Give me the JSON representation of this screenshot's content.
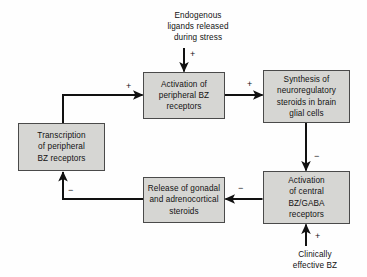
{
  "diagram": {
    "background_color": "#fefefe",
    "node_fill_color": "#d6d6d3",
    "node_border_color": "#4a4a4a",
    "edge_color": "#111111",
    "text_color": "#121212",
    "nodes": [
      {
        "id": "activation-peripheral",
        "label": "Activation of\nperipheral BZ\nreceptors",
        "lines": [
          "Activation of",
          "peripheral BZ",
          "receptors"
        ]
      },
      {
        "id": "synthesis-steroids",
        "label": "Synthesis of\nneuroregulatory\nsteroids in brain\nglial cells",
        "lines": [
          "Synthesis of",
          "neuroregulatory",
          "steroids in brain",
          "glial cells"
        ]
      },
      {
        "id": "transcription",
        "label": "Transcription\nof peripheral\nBZ receptors",
        "lines": [
          "Transcription",
          "of peripheral",
          "BZ receptors"
        ]
      },
      {
        "id": "release-gonadal",
        "label": "Release of gonadal\nand adrenocortical\nsteroids",
        "lines": [
          "Release of gonadal",
          "and adrenocortical",
          "steroids"
        ]
      },
      {
        "id": "activation-central",
        "label": "Activation\nof central\nBZ/GABA\nreceptors",
        "lines": [
          "Activation",
          "of central",
          "BZ/GABA",
          "receptors"
        ]
      }
    ],
    "free_labels": [
      {
        "id": "endogenous",
        "label": "Endogenous\nligands released\nduring stress",
        "lines": [
          "Endogenous",
          "ligands released",
          "during stress"
        ]
      },
      {
        "id": "clinically",
        "label": "Clinically\neffective BZ",
        "lines": [
          "Clinically",
          "effective BZ"
        ]
      }
    ],
    "edges": [
      {
        "id": "endogenous-to-peripheral",
        "from": "endogenous-ligands",
        "to": "activation-peripheral",
        "sign": "+"
      },
      {
        "id": "peripheral-to-synthesis",
        "from": "activation-peripheral",
        "to": "synthesis-steroids",
        "sign": "+"
      },
      {
        "id": "synthesis-to-central",
        "from": "synthesis-steroids",
        "to": "activation-central",
        "sign": "−"
      },
      {
        "id": "central-to-release",
        "from": "activation-central",
        "to": "release-gonadal",
        "sign": "−"
      },
      {
        "id": "release-to-transcription",
        "from": "release-gonadal",
        "to": "transcription",
        "sign": "−"
      },
      {
        "id": "transcription-to-peripheral",
        "from": "transcription",
        "to": "activation-peripheral",
        "sign": "+"
      },
      {
        "id": "clinically-to-central",
        "from": "clinically-effective-bz",
        "to": "activation-central",
        "sign": "+"
      }
    ]
  }
}
